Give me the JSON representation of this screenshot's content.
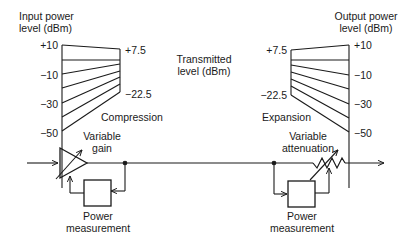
{
  "diagram": {
    "left_scale": {
      "title_line1": "Input power",
      "title_line2": "level (dBm)",
      "ticks": [
        "+10",
        "−10",
        "−30",
        "−50"
      ]
    },
    "compression": {
      "top_value": "+7.5",
      "bottom_value": "−22.5",
      "label": "Compression"
    },
    "center_label": {
      "line1": "Transmitted",
      "line2": "level (dBm)"
    },
    "expansion": {
      "top_value": "+7.5",
      "bottom_value": "−22.5",
      "label": "Expansion"
    },
    "right_scale": {
      "title_line1": "Output power",
      "title_line2": "level (dBm)",
      "ticks": [
        "+10",
        "−10",
        "−30",
        "−50"
      ]
    },
    "blocks": {
      "variable_gain_line1": "Variable",
      "variable_gain_line2": "gain",
      "variable_attenuation_line1": "Variable",
      "variable_attenuation_line2": "attenuation",
      "power_measurement_1_line1": "Power",
      "power_measurement_1_line2": "measurement",
      "power_measurement_2_line1": "Power",
      "power_measurement_2_line2": "measurement"
    },
    "colors": {
      "stroke": "#1a1a1a",
      "background": "#ffffff"
    }
  }
}
